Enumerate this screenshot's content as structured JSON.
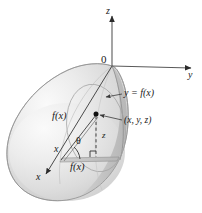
{
  "figure": {
    "caption": "Solid of revolution generated by rotating y = f(x) about the x-axis, shown with 3D coordinate axes",
    "colors": {
      "ink": "#1a1a1a",
      "axis": "#4d4d4d",
      "surface_light": "#f2f2f2",
      "surface_mid": "#d4d4d4",
      "surface_dark": "#b9b9b9",
      "outline": "#8c8c8c",
      "background": "#ffffff"
    },
    "axes": {
      "z_label": "z",
      "y_label": "y",
      "x_label": "x",
      "origin_label": "0"
    },
    "labels": {
      "curve_equation": "y = f(x)",
      "point_coordinates": "(x, y, z)",
      "radius_upper": "f(x)",
      "radius_lower": "f(x)",
      "angle": "θ",
      "height": "z",
      "x_coordinate": "x"
    },
    "geometry": {
      "origin": {
        "x": 112,
        "y": 66
      },
      "point": {
        "x": 96,
        "y": 115
      },
      "z_axis_tip": {
        "x": 112,
        "y": 14
      },
      "y_axis_tip": {
        "x": 194,
        "y": 66
      },
      "x_axis_tip": {
        "x": 43,
        "y": 176
      }
    }
  }
}
